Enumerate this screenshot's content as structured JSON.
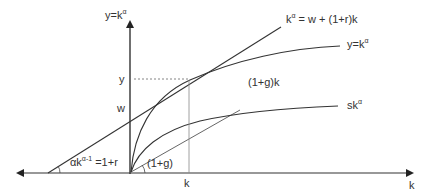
{
  "diagram": {
    "type": "economic-growth-diagram",
    "colors": {
      "line": "#333333",
      "thin_line": "#555555",
      "dashed": "#666666",
      "background": "#ffffff"
    },
    "axes": {
      "y_axis_label": "y=k",
      "y_axis_label_sup": "α",
      "x_axis_label": "k"
    },
    "ticks": {
      "y_value": "y",
      "w_value": "w",
      "k_value": "k"
    },
    "curves": {
      "tangent_line_label": "k",
      "tangent_line_label_sup": "α",
      "tangent_line_label_rest": " = w + (1+r)k",
      "production_label": "y=k",
      "production_label_sup": "α",
      "growth_line_label": "(1+g)k",
      "savings_label": "sk",
      "savings_label_sup": "α"
    },
    "angles": {
      "tangent_slope_prefix": "αk",
      "tangent_slope_sup": "α-1",
      "tangent_slope_rest": " =1+r",
      "growth_slope": "(1+g)"
    }
  }
}
